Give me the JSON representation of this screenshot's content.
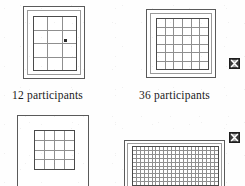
{
  "figure": {
    "background_color": "#fefefe",
    "line_color": "#5a5a5a",
    "grid_line_color": "#8f8f8f",
    "text_color": "#1a1a1a"
  },
  "panels": [
    {
      "id": "panel-top-left",
      "name": "grid-panel-12",
      "columns": 3,
      "rows": 4,
      "cell_count": 12,
      "has_marker": true,
      "cropped": false
    },
    {
      "id": "panel-top-right",
      "name": "grid-panel-36",
      "columns": 6,
      "rows": 6,
      "cell_count": 36,
      "has_marker": false,
      "cropped": false
    },
    {
      "id": "panel-bottom-left",
      "name": "grid-panel-16",
      "columns": 4,
      "rows": 4,
      "cell_count": 16,
      "has_marker": false,
      "cropped": true
    },
    {
      "id": "panel-bottom-right",
      "name": "grid-panel-dense",
      "columns": 22,
      "rows": 10,
      "cell_count": 220,
      "has_marker": false,
      "cropped": true
    }
  ],
  "captions": [
    {
      "text": "12 participants"
    },
    {
      "text": "36 participants"
    }
  ],
  "edge_icons": [
    {
      "name": "bowtie-marker-icon",
      "glyph": "bowtie-cross"
    },
    {
      "name": "bowtie-marker-icon",
      "glyph": "bowtie-cross"
    }
  ]
}
